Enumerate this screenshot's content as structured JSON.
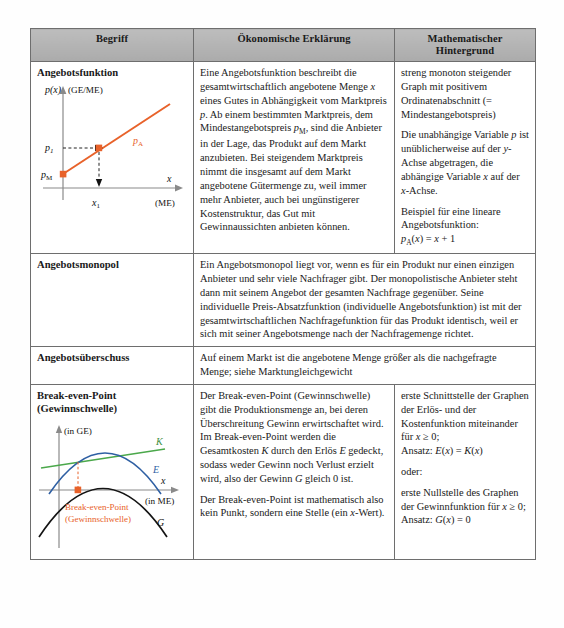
{
  "table": {
    "headers": [
      "Begriff",
      "Ökonomische Erklärung",
      "Mathematischer Hintergrund"
    ],
    "rows": [
      {
        "term": "Angebotsfunktion",
        "has_figure": true,
        "figure_name": "angebotsfunktion-diagram",
        "econ": [
          "Eine Angebotsfunktion beschreibt die gesamtwirtschaftlich angebotene Menge x eines Gutes in Abhängigkeit vom Marktpreis p. Ab einem bestimmten Marktpreis, dem Mindestangebotspreis p_M, sind die Anbieter in der Lage, das Produkt auf dem Markt anzubieten. Bei steigendem Marktpreis nimmt die insgesamt auf dem Markt angebotene Gütermenge zu, weil immer mehr Anbieter, auch bei ungünstigerer Kostenstruktur, das Gut mit Gewinnaussichten anbieten können."
        ],
        "math": [
          "streng monoton steigender Graph mit positivem Ordinatenabschnitt (= Mindestangebotspreis)",
          "Die unabhängige Variable p ist unüblicherweise auf der y-Achse abgetragen, die abhängige Variable x auf der x-Achse.",
          "Beispiel für eine lineare Angebotsfunktion:",
          "p_A(x) = x + 1"
        ]
      },
      {
        "term": "Angebotsmonopol",
        "has_figure": false,
        "econ_full": "Ein Angebotsmonopol liegt vor, wenn es für ein Produkt nur einen einzigen Anbieter und sehr viele Nachfrager gibt. Der monopolistische Anbieter steht dann mit seinem Angebot der gesamten Nachfrage gegenüber. Seine individuelle Preis-Absatzfunktion (individuelle Angebotsfunktion) ist mit der gesamtwirtschaftlichen Nachfragefunktion für das Produkt identisch, weil er sich mit seiner Angebotsmenge nach der Nachfragemenge richtet."
      },
      {
        "term": "Angebotsüberschuss",
        "has_figure": false,
        "econ_full": "Auf einem Markt ist die angebotene Menge größer als die nachgefragte Menge; siehe Marktungleichgewicht"
      },
      {
        "term": "Break-even-Point (Gewinnschwelle)",
        "has_figure": true,
        "figure_name": "break-even-point-diagram",
        "econ": [
          "Der Break-even-Point (Gewinnschwelle) gibt die Produktionsmenge an, bei deren Überschreitung Gewinn erwirtschaftet wird. Im Break-even-Point werden die Gesamtkosten K durch den Erlös E gedeckt, sodass weder Gewinn noch Verlust erzielt wird, also der Gewinn G gleich 0 ist.",
          "Der Break-even-Point ist mathematisch also kein Punkt, sondern eine Stelle (ein x-Wert)."
        ],
        "math": [
          "erste Schnittstelle der Graphen der Erlös- und der Kostenfunktion miteinander für x ≥ 0;",
          "Ansatz: E(x) = K(x)",
          "oder:",
          "erste Nullstelle des Graphen der Gewinnfunktion für x ≥ 0;",
          "Ansatz: G(x) = 0"
        ]
      }
    ]
  },
  "figures": {
    "angebotsfunktion": {
      "y_axis_label": "p(x)",
      "y_unit_label": "(GE/ME)",
      "x_axis_label": "x",
      "x_unit_label": "(ME)",
      "curve_label": "p_A",
      "point_labels": [
        "p_1",
        "p_M",
        "x_1"
      ],
      "curve_color": "#e8622a",
      "axis_color": "#7a7a7a",
      "type": "line"
    },
    "break_even": {
      "y_unit_label": "(in GE)",
      "x_axis_label": "x",
      "x_unit_label": "(in ME)",
      "curve_labels": {
        "kosten": "K",
        "erloes": "E",
        "gewinn": "G"
      },
      "annotation_line1": "Break-even-Point",
      "annotation_line2": "(Gewinnschwelle)",
      "colors": {
        "kosten": "#4ba84b",
        "erloes": "#2e5fa3",
        "gewinn": "#111111",
        "marker": "#e8622a",
        "axis": "#7a7a7a"
      },
      "type": "line"
    }
  }
}
